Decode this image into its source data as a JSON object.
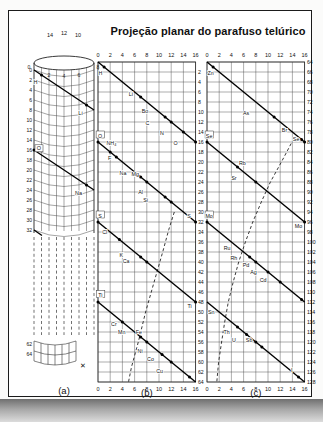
{
  "page": {
    "title": "Projeção planar do parafuso telúrico",
    "ink_color": "#1b1b1b",
    "grid_color": "#4a4a4a",
    "paper_color": "#ffffff"
  },
  "panels": {
    "a": {
      "caption": "(a)",
      "top_labels": [
        "14",
        "12",
        "10"
      ],
      "rim_labels": [
        "0",
        "2",
        "4",
        "6",
        "8"
      ],
      "side_ticks": [
        "0",
        "2",
        "4",
        "6",
        "8",
        "10",
        "12",
        "14",
        "16",
        "18",
        "20",
        "22",
        "24",
        "26",
        "28",
        "30",
        "32"
      ],
      "bottom_ticks": [
        "62",
        "64"
      ],
      "x_mark": "✕",
      "elements": [
        {
          "symbol": "H",
          "value": 1,
          "dx": -6,
          "dy": 7
        },
        {
          "symbol": "Li",
          "value": 7,
          "dx": -6,
          "dy": 8
        },
        {
          "symbol": "O",
          "value": 16,
          "dx": 5,
          "dy": -2,
          "boxed": true
        },
        {
          "symbol": "Na",
          "value": 23,
          "dx": -8,
          "dy": 8
        }
      ]
    },
    "b": {
      "caption": "(b)",
      "base": 0,
      "axis_top": [
        "0",
        "2",
        "4",
        "6",
        "8",
        "10",
        "12",
        "14",
        "16"
      ],
      "axis_bottom": [
        "0",
        "2",
        "4",
        "6",
        "8",
        "10",
        "12",
        "14",
        "16"
      ],
      "right_ticks": [
        "2",
        "4",
        "6",
        "8",
        "10",
        "12",
        "14",
        "16",
        "18",
        "20",
        "22",
        "24",
        "26",
        "28",
        "30",
        "32",
        "34",
        "36",
        "38",
        "40",
        "42",
        "44",
        "46",
        "48",
        "50",
        "52",
        "54",
        "56",
        "58",
        "60",
        "62",
        "64"
      ],
      "right_offset": 2,
      "elements": [
        {
          "s": "H",
          "v": 1,
          "lx": 0.4,
          "ly": 2.3
        },
        {
          "s": "Li",
          "v": 7,
          "lx": 5.4,
          "ly": 6.5
        },
        {
          "s": "Bo",
          "v": 11,
          "lx": 7.7,
          "ly": 9.9
        },
        {
          "s": "C",
          "v": 12,
          "lx": 8.1,
          "ly": 12.3
        },
        {
          "s": "N",
          "v": 14,
          "lx": 10.5,
          "ly": 14.3
        },
        {
          "s": "O",
          "v": 16,
          "lx": 12.7,
          "ly": 16.3
        },
        {
          "s": "O",
          "lx": 0.35,
          "ly": 14.8,
          "boxed": true
        },
        {
          "s": "NH₄",
          "v": 18,
          "lx": 2.2,
          "ly": 16.3
        },
        {
          "s": "F",
          "v": 19,
          "lx": 1.9,
          "ly": 19.3
        },
        {
          "s": "Na",
          "v": 23,
          "lx": 4.1,
          "ly": 22.3
        },
        {
          "s": "Mg",
          "v": 24,
          "lx": 6.1,
          "ly": 22.5
        },
        {
          "s": "Al",
          "v": 27,
          "lx": 7.0,
          "ly": 26.1
        },
        {
          "s": "Si",
          "v": 28,
          "lx": 7.8,
          "ly": 27.7
        },
        {
          "s": "S",
          "v": 32,
          "lx": 14.9,
          "ly": 30.9
        },
        {
          "s": "S",
          "lx": 0.35,
          "ly": 30.8,
          "boxed": true
        },
        {
          "s": "Cl",
          "v": 35.5,
          "lx": 1.1,
          "ly": 34.1
        },
        {
          "s": "K",
          "v": 39,
          "lx": 3.8,
          "ly": 38.7
        },
        {
          "s": "Ca",
          "v": 40,
          "lx": 4.6,
          "ly": 39.9
        },
        {
          "s": "Ti",
          "lx": 0.4,
          "ly": 46.7,
          "boxed": true
        },
        {
          "s": "Ti",
          "v": 48,
          "lx": 15.0,
          "ly": 48.9
        },
        {
          "s": "Cr",
          "v": 52,
          "lx": 2.6,
          "ly": 52.5
        },
        {
          "s": "Mn",
          "v": 55,
          "lx": 3.9,
          "ly": 54.1
        },
        {
          "s": "Fe",
          "v": 56,
          "lx": 6.7,
          "ly": 54.1
        },
        {
          "s": "Ni",
          "v": 58.5,
          "lx": 6.9,
          "ly": 57.9
        },
        {
          "s": "Co",
          "v": 60,
          "lx": 8.6,
          "ly": 59.5
        },
        {
          "s": "Cu",
          "v": 63,
          "lx": 10.1,
          "ly": 61.9
        }
      ],
      "dashed": [
        [
          12.5,
          30
        ],
        [
          11.6,
          33.5
        ],
        [
          10.6,
          38
        ],
        [
          9.2,
          44
        ],
        [
          7.8,
          50
        ],
        [
          6.6,
          56
        ],
        [
          5.5,
          61
        ],
        [
          5.0,
          64
        ]
      ]
    },
    "c": {
      "caption": "(c)",
      "base": 64,
      "axis_top": [
        "0",
        "2",
        "4",
        "6",
        "8",
        "10",
        "12",
        "14",
        "16"
      ],
      "axis_bottom": [
        "0",
        "2",
        "4",
        "6",
        "8",
        "10",
        "12",
        "14",
        "16"
      ],
      "right_ticks": [
        "64",
        "66",
        "68",
        "70",
        "72",
        "74",
        "76",
        "78",
        "80",
        "82",
        "84",
        "86",
        "88",
        "90",
        "92",
        "94",
        "96",
        "98",
        "100",
        "102",
        "104",
        "106",
        "108",
        "110",
        "112",
        "114",
        "116",
        "118",
        "120",
        "122",
        "124",
        "126",
        "128"
      ],
      "right_offset": 0,
      "elements": [
        {
          "s": "Zn",
          "v": 65,
          "lx": 0.6,
          "ly": 66.3
        },
        {
          "s": "As",
          "v": 75,
          "lx": 6.4,
          "ly": 74.3
        },
        {
          "s": "Br",
          "v": 79.5,
          "lx": 12.7,
          "ly": 77.7
        },
        {
          "s": "Se",
          "v": 80,
          "lx": 14.6,
          "ly": 79.4
        },
        {
          "s": "Se",
          "lx": 0.35,
          "ly": 78.8,
          "boxed": true
        },
        {
          "s": "Rb",
          "v": 85,
          "lx": 5.8,
          "ly": 84.3
        },
        {
          "s": "Sr",
          "v": 88,
          "lx": 4.4,
          "ly": 87.3
        },
        {
          "s": "Mo",
          "v": 96,
          "lx": 15.0,
          "ly": 96.9
        },
        {
          "s": "Mo",
          "lx": 0.35,
          "ly": 94.8,
          "boxed": true
        },
        {
          "s": "Ru",
          "v": 103,
          "lx": 3.3,
          "ly": 101.3
        },
        {
          "s": "Rh",
          "v": 104,
          "lx": 4.4,
          "ly": 103.3
        },
        {
          "s": "Pd",
          "v": 106,
          "lx": 6.4,
          "ly": 104.7
        },
        {
          "s": "Ag",
          "v": 108,
          "lx": 7.6,
          "ly": 106.1
        },
        {
          "s": "Cd",
          "v": 111.5,
          "lx": 9.2,
          "ly": 107.7
        },
        {
          "s": "Sn",
          "v": 117,
          "lx": 0.7,
          "ly": 114.1
        },
        {
          "s": "Th",
          "v": 118.5,
          "lx": 3.2,
          "ly": 118.1
        },
        {
          "s": "U",
          "v": 120,
          "lx": 4.4,
          "ly": 119.7
        },
        {
          "s": "Sb",
          "v": 121,
          "lx": 6.9,
          "ly": 119.7
        },
        {
          "s": "I",
          "v": 127,
          "lx": 13.9,
          "ly": 125.7
        }
      ],
      "dashed": [
        [
          13.8,
          80.3
        ],
        [
          12.2,
          84
        ],
        [
          10.4,
          88
        ],
        [
          8.9,
          92
        ],
        [
          7.5,
          96
        ],
        [
          6.3,
          100
        ],
        [
          5.2,
          104
        ],
        [
          4.3,
          108
        ],
        [
          3.5,
          112
        ],
        [
          2.9,
          116
        ],
        [
          2.4,
          120
        ],
        [
          1.9,
          124
        ],
        [
          1.6,
          128
        ]
      ]
    }
  }
}
